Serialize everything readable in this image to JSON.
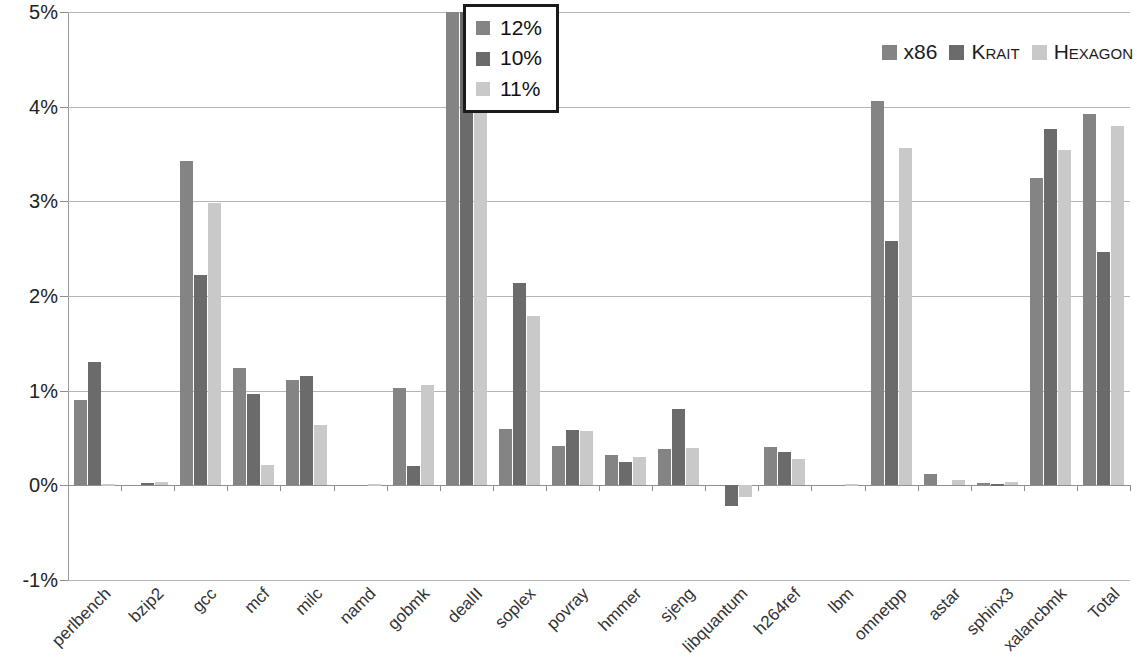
{
  "chart_data": {
    "type": "bar",
    "title": "",
    "subtitle": "",
    "xlabel": "",
    "ylabel": "",
    "ylim": [
      -1,
      5
    ],
    "ytick_labels": [
      "5%",
      "4%",
      "3%",
      "2%",
      "1%",
      "0%",
      "-1%"
    ],
    "ytick_values": [
      5,
      4,
      3,
      2,
      1,
      0,
      -1
    ],
    "grid": true,
    "legend_position": "top-right",
    "categories": [
      "perlbench",
      "bzip2",
      "gcc",
      "mcf",
      "milc",
      "namd",
      "gobmk",
      "dealII",
      "soplex",
      "povray",
      "hmmer",
      "sjeng",
      "libquantum",
      "h264ref",
      "lbm",
      "omnetpp",
      "astar",
      "sphinx3",
      "xalancbmk",
      "Total"
    ],
    "series": [
      {
        "name": "x86",
        "color": "#848484",
        "values": [
          0.9,
          0.0,
          3.43,
          1.24,
          1.11,
          0.0,
          1.03,
          5.6,
          0.6,
          0.42,
          0.32,
          0.38,
          0.0,
          0.41,
          0.0,
          4.06,
          0.12,
          0.02,
          3.25,
          3.92
        ]
      },
      {
        "name": "Krait",
        "color": "#6b6b6b",
        "values": [
          1.3,
          0.02,
          2.22,
          0.97,
          1.15,
          0.0,
          0.2,
          5.55,
          2.14,
          0.58,
          0.25,
          0.81,
          -0.22,
          0.35,
          0.0,
          2.58,
          0.0,
          0.01,
          3.76,
          2.46
        ]
      },
      {
        "name": "Hexagon",
        "color": "#c9c9c9",
        "values": [
          0.01,
          0.03,
          2.98,
          0.22,
          0.64,
          0.01,
          1.06,
          5.5,
          1.79,
          0.57,
          0.3,
          0.39,
          -0.12,
          0.28,
          0.01,
          3.56,
          0.06,
          0.04,
          3.54,
          3.8
        ]
      }
    ]
  },
  "legend": {
    "items": [
      {
        "label": "x86",
        "color": "#848484",
        "smallcaps": false
      },
      {
        "label": "Krait",
        "color": "#6b6b6b",
        "smallcaps": true
      },
      {
        "label": "Hexagon",
        "color": "#c9c9c9",
        "smallcaps": true
      }
    ]
  },
  "callout": {
    "rows": [
      {
        "value": "12%",
        "color": "#848484"
      },
      {
        "value": "10%",
        "color": "#6b6b6b"
      },
      {
        "value": "11%",
        "color": "#c9c9c9"
      }
    ]
  }
}
